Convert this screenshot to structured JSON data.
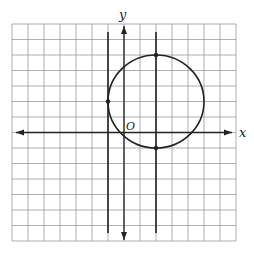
{
  "figure": {
    "type": "coordinate-grid-diagram",
    "grid": {
      "x_min": -7,
      "x_max": 7,
      "y_min": -7,
      "y_max": 7,
      "step": 1,
      "line_color": "#9a9a9a"
    },
    "axes": {
      "x_label": "x",
      "y_label": "y",
      "origin_label": "O",
      "color": "#222222"
    },
    "circle": {
      "center": [
        2,
        2
      ],
      "radius": 3,
      "color": "#222222"
    },
    "vertical_lines": [
      {
        "x": -1,
        "label": "tangent line at x = -1"
      },
      {
        "x": 2,
        "label": "line through center at x = 2"
      }
    ],
    "points": [
      {
        "x": -1,
        "y": 2,
        "label": "left tangent point"
      },
      {
        "x": 2,
        "y": 5,
        "label": "top intersection"
      },
      {
        "x": 2,
        "y": -1,
        "label": "bottom intersection"
      }
    ]
  }
}
